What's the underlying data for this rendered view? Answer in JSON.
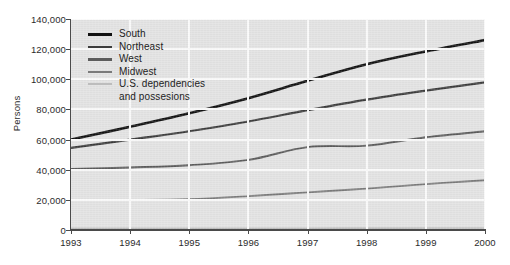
{
  "chart_data": {
    "type": "line",
    "title": "",
    "xlabel": "",
    "ylabel": "Persons",
    "x": [
      1993,
      1994,
      1995,
      1996,
      1997,
      1998,
      1999,
      2000
    ],
    "xtick_labels": [
      "1993",
      "1994",
      "1995",
      "1996",
      "1997",
      "1998",
      "1999",
      "2000"
    ],
    "ytick_labels": [
      "140,000",
      "120,000",
      "100,000",
      "80,000",
      "60,000",
      "40,000",
      "20,000",
      "0"
    ],
    "ytick_values": [
      140000,
      120000,
      100000,
      80000,
      60000,
      40000,
      20000,
      0
    ],
    "ylim": [
      0,
      140000
    ],
    "xlim": [
      1993,
      2000
    ],
    "grid": true,
    "grid_color": "#fafafa",
    "plot_background": "#e2e2e2",
    "legend_position": "upper-left-inside",
    "series": [
      {
        "name": "South",
        "color": "#111111",
        "width": 2.6,
        "values": [
          60000,
          68500,
          77500,
          87500,
          99000,
          110000,
          118500,
          126000
        ]
      },
      {
        "name": "Northeast",
        "color": "#3d3d3d",
        "width": 2.2,
        "values": [
          54500,
          60000,
          65500,
          72000,
          79500,
          86500,
          92500,
          98000
        ]
      },
      {
        "name": "West",
        "color": "#5c5c5c",
        "width": 1.9,
        "values": [
          40500,
          41500,
          43000,
          46500,
          55000,
          56000,
          61500,
          65500
        ]
      },
      {
        "name": "Midwest",
        "color": "#7a7a7a",
        "width": 1.8,
        "values": [
          20000,
          20000,
          20500,
          22500,
          25000,
          27500,
          30500,
          33000
        ]
      },
      {
        "name": "U.S. dependencies and possesions",
        "color": "#bdbdbd",
        "width": 1.6,
        "values": [
          1100,
          1100,
          1100,
          1150,
          1200,
          1250,
          1300,
          1350
        ]
      }
    ]
  },
  "legend": {
    "entries": [
      {
        "label": "South",
        "color": "#111111",
        "thickness": 3.2
      },
      {
        "label": "Northeast",
        "color": "#3d3d3d",
        "thickness": 2.8
      },
      {
        "label": "West",
        "color": "#5c5c5c",
        "thickness": 2.4
      },
      {
        "label": "Midwest",
        "color": "#7a7a7a",
        "thickness": 2.2
      },
      {
        "label": "U.S. dependencies",
        "color": "#bdbdbd",
        "thickness": 1.8
      }
    ],
    "continuation_line": "and possesions"
  }
}
